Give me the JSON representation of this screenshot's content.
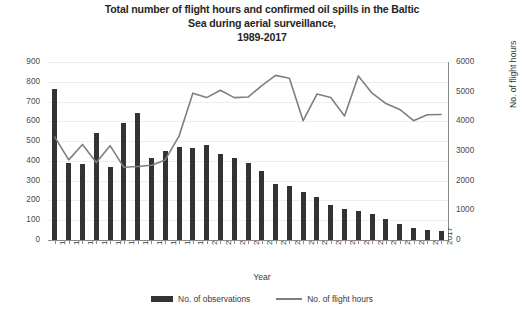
{
  "chart_data": {
    "type": "bar",
    "title": "Total number of flight hours and confirmed oil spills in the Baltic Sea during aerial surveillance, 1989-2017",
    "title_lines": [
      "Total number of flight hours and confirmed oil spills in the Baltic",
      "Sea during aerial surveillance,",
      "1989-2017"
    ],
    "xlabel": "Year",
    "ylabel": "No. of observed oil spills",
    "ylabel_secondary": "No. of flight hours",
    "ylim": [
      0,
      900
    ],
    "ylim_secondary": [
      0,
      6000
    ],
    "yticks": [
      900,
      800,
      700,
      600,
      500,
      400,
      300,
      200,
      100,
      0
    ],
    "yticks_secondary": [
      6000,
      5000,
      4000,
      3000,
      2000,
      1000,
      0
    ],
    "grid": true,
    "legend_position": "bottom",
    "categories": [
      "1989",
      "1990",
      "1991",
      "1992",
      "1993",
      "1994",
      "1995",
      "1996",
      "1997",
      "1998",
      "1999",
      "2000",
      "2001",
      "2002",
      "2003",
      "2004",
      "2005",
      "2006",
      "2007",
      "2008",
      "2009",
      "2010",
      "2011",
      "2012",
      "2013",
      "2014",
      "2015",
      "2016",
      "2017"
    ],
    "series": [
      {
        "name": "No. of observations",
        "type": "bar",
        "axis": "left",
        "color": "#333333",
        "values": [
          763,
          390,
          385,
          540,
          370,
          590,
          640,
          415,
          450,
          470,
          465,
          480,
          435,
          415,
          390,
          350,
          285,
          275,
          245,
          215,
          175,
          155,
          145,
          130,
          105,
          80,
          60,
          50,
          45
        ]
      },
      {
        "name": "No. of flight hours",
        "type": "line",
        "axis": "right",
        "color": "#7f7f7f",
        "values": [
          3470,
          2700,
          3220,
          2610,
          3180,
          2450,
          2480,
          2520,
          2700,
          3500,
          4950,
          4800,
          5050,
          4800,
          4820,
          5200,
          5550,
          5450,
          4020,
          4920,
          4800,
          4180,
          5530,
          4950,
          4600,
          4400,
          4020,
          4220,
          4230
        ]
      }
    ]
  },
  "legend": {
    "items": [
      {
        "label": "No. of observations",
        "marker": "bar-swatch"
      },
      {
        "label": "No. of flight hours",
        "marker": "line-swatch"
      }
    ]
  }
}
